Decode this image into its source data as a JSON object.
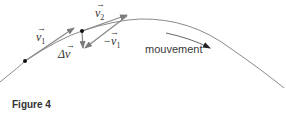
{
  "figure": {
    "caption": "Figure 4",
    "labels": {
      "v1": "v",
      "v1_sub": "1",
      "v2": "v",
      "v2_sub": "2",
      "neg_v1": "−v",
      "neg_v1_sub": "1",
      "delta_v": "Δv",
      "arrow_glyph": "→",
      "motion": "mouvement"
    },
    "colors": {
      "curve": "#808080",
      "vector": "#8a8a8a",
      "point": "#111111",
      "text": "#333333"
    }
  }
}
